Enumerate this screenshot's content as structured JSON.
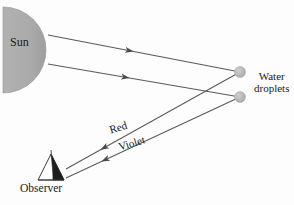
{
  "figure": {
    "background_color": "#fdfdfd",
    "line_color": "#5a5a5a",
    "sun_fill": "#a9a9a9",
    "droplet_fill": "#b4b4b4",
    "text_color": "#1a1a1a"
  },
  "labels": {
    "sun": "Sun",
    "water_droplets_line1": "Water",
    "water_droplets_line2": "droplets",
    "observer": "Observer",
    "red_ray": "Red",
    "violet_ray": "Violet"
  },
  "elements": {
    "sun": {
      "name": "sun-semicircle",
      "shape": "semicircle",
      "center_x": 3,
      "center_y": 50,
      "radius": 43,
      "fill": "#a9a9a9"
    },
    "droplets": [
      {
        "name": "water-droplet-upper",
        "cx": 240,
        "cy": 72,
        "r": 5.5,
        "fill": "#b4b4b4"
      },
      {
        "name": "water-droplet-lower",
        "cx": 240,
        "cy": 97,
        "r": 5.5,
        "fill": "#b4b4b4"
      }
    ],
    "observer": {
      "name": "observer-figure",
      "x": 38,
      "y": 155,
      "width": 26,
      "height": 26
    }
  },
  "rays": {
    "incoming": [
      {
        "name": "sunray-upper",
        "from_x": 48,
        "from_y": 35,
        "to_x": 240,
        "to_y": 72,
        "arrow_at": 0.42,
        "direction": "right"
      },
      {
        "name": "sunray-lower",
        "from_x": 48,
        "from_y": 64,
        "to_x": 240,
        "to_y": 97,
        "arrow_at": 0.4,
        "direction": "right"
      }
    ],
    "outgoing": [
      {
        "name": "red-ray",
        "from_x": 240,
        "from_y": 72,
        "to_x": 66,
        "to_y": 169,
        "arrow_at": 0.8,
        "direction": "left",
        "label": "Red"
      },
      {
        "name": "violet-ray",
        "from_x": 240,
        "from_y": 97,
        "to_x": 66,
        "to_y": 178,
        "arrow_at": 0.78,
        "direction": "left",
        "label": "Violet"
      }
    ]
  }
}
